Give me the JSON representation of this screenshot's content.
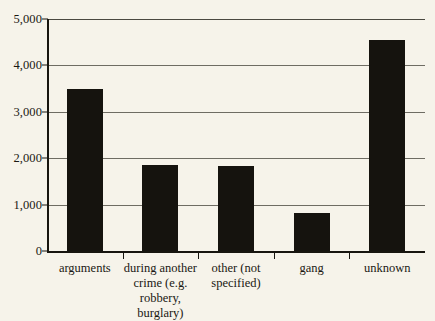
{
  "chart_data": {
    "type": "bar",
    "title": "",
    "subtitle": "",
    "xlabel": "",
    "ylabel": "",
    "ylim": [
      0,
      5000
    ],
    "grid": true,
    "legend": false,
    "categories": [
      "arguments",
      "during another crime (e.g. robbery, burglary)",
      "other (not specified)",
      "gang",
      "unknown"
    ],
    "values": [
      3490,
      1850,
      1830,
      830,
      4550
    ],
    "y_ticks": [
      0,
      1000,
      2000,
      3000,
      4000,
      5000
    ],
    "y_tick_labels": [
      "0",
      "1,000",
      "2,000",
      "3,000",
      "4,000",
      "5,000"
    ]
  },
  "category_label_lines": [
    [
      "arguments"
    ],
    [
      "during another",
      "crime (e.g.",
      "robbery, burglary)"
    ],
    [
      "other (not",
      "specified)"
    ],
    [
      "gang"
    ],
    [
      "unknown"
    ]
  ],
  "colors": {
    "background": "#f6f3ea",
    "bar": "#15130e",
    "gridline": "#6e6c63",
    "axis": "#17150f",
    "text": "#1a1812"
  }
}
